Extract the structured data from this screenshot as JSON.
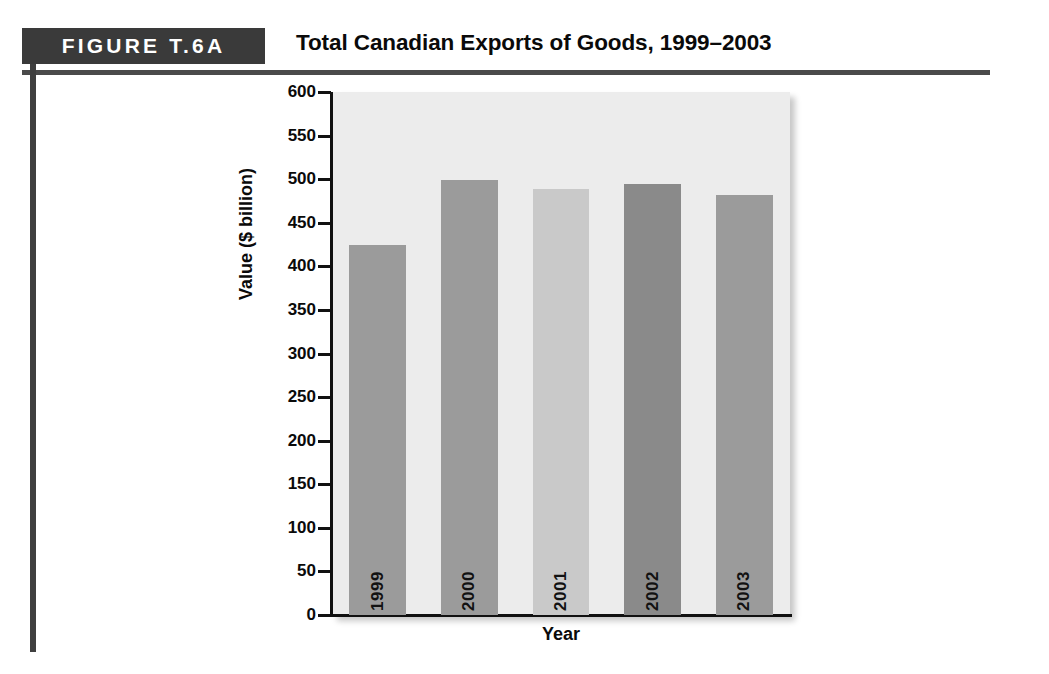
{
  "header": {
    "figure_label": "FIGURE T.6A",
    "title": "Total Canadian Exports of Goods, 1999–2003"
  },
  "chart_data": {
    "type": "bar",
    "title": "Total Canadian Exports of Goods, 1999–2003",
    "xlabel": "Year",
    "ylabel": "Value ($ billion)",
    "categories": [
      "1999",
      "2000",
      "2001",
      "2002",
      "2003"
    ],
    "values": [
      425,
      499,
      489,
      494,
      482
    ],
    "ylim": [
      0,
      600
    ],
    "yticks": [
      0,
      50,
      100,
      150,
      200,
      250,
      300,
      350,
      400,
      450,
      500,
      550,
      600
    ],
    "ytick_labels": [
      "0",
      "50",
      "100",
      "150",
      "200",
      "250",
      "300",
      "350",
      "400",
      "450",
      "500",
      "550",
      "600"
    ],
    "grid": false,
    "legend": null,
    "bar_colors": [
      "#9b9b9b",
      "#9b9b9b",
      "#c9c9c9",
      "#8a8a8a",
      "#9b9b9b"
    ],
    "plot_background": "#ececec"
  },
  "colors": {
    "band": "#3a3a3a",
    "rule": "#4a4a4a",
    "axis": "#111111",
    "text": "#0a0a0a"
  }
}
